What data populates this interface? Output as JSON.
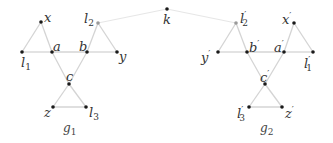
{
  "diagram": {
    "type": "graph",
    "colors": {
      "node": "#1a1a1a",
      "node_special": "#9a9a9a",
      "edge": "#d4d4d4",
      "edge_faint": "#e6e6e6",
      "label": "#333333"
    },
    "graphs": [
      {
        "name": "g1",
        "label_base": "g",
        "label_sub": "1",
        "nodes": [
          {
            "id": "x",
            "base": "x",
            "sub": "",
            "prime": "",
            "x": 41,
            "y": 22
          },
          {
            "id": "l1",
            "base": "l",
            "sub": "1",
            "prime": "",
            "x": 22,
            "y": 52
          },
          {
            "id": "a",
            "base": "a",
            "sub": "",
            "prime": "",
            "x": 52,
            "y": 52
          },
          {
            "id": "b",
            "base": "b",
            "sub": "",
            "prime": "",
            "x": 87,
            "y": 52
          },
          {
            "id": "y",
            "base": "y",
            "sub": "",
            "prime": "",
            "x": 117,
            "y": 52
          },
          {
            "id": "l2",
            "base": "l",
            "sub": "2",
            "prime": "",
            "x": 98,
            "y": 23
          },
          {
            "id": "c",
            "base": "c",
            "sub": "",
            "prime": "",
            "x": 69,
            "y": 84
          },
          {
            "id": "z",
            "base": "z",
            "sub": "",
            "prime": "",
            "x": 53,
            "y": 107
          },
          {
            "id": "l3",
            "base": "l",
            "sub": "3",
            "prime": "",
            "x": 86,
            "y": 107
          }
        ],
        "edges": [
          [
            "x",
            "l1"
          ],
          [
            "x",
            "a"
          ],
          [
            "l1",
            "a"
          ],
          [
            "a",
            "b"
          ],
          [
            "b",
            "y"
          ],
          [
            "l2",
            "b"
          ],
          [
            "l2",
            "y"
          ],
          [
            "a",
            "c"
          ],
          [
            "b",
            "c"
          ],
          [
            "c",
            "z"
          ],
          [
            "c",
            "l3"
          ],
          [
            "z",
            "l3"
          ]
        ]
      },
      {
        "name": "g2",
        "label_base": "g",
        "label_sub": "2",
        "nodes": [
          {
            "id": "l2p",
            "base": "l",
            "sub": "2",
            "prime": "′",
            "x": 236,
            "y": 23
          },
          {
            "id": "xp",
            "base": "x",
            "sub": "",
            "prime": "′",
            "x": 294,
            "y": 23
          },
          {
            "id": "yp",
            "base": "y",
            "sub": "",
            "prime": "′",
            "x": 218,
            "y": 52
          },
          {
            "id": "bp",
            "base": "b",
            "sub": "",
            "prime": "′",
            "x": 247,
            "y": 52
          },
          {
            "id": "ap",
            "base": "a",
            "sub": "",
            "prime": "′",
            "x": 284,
            "y": 52
          },
          {
            "id": "l1p",
            "base": "l",
            "sub": "1",
            "prime": "′",
            "x": 313,
            "y": 52
          },
          {
            "id": "cp",
            "base": "c",
            "sub": "",
            "prime": "′",
            "x": 265,
            "y": 84
          },
          {
            "id": "l3p",
            "base": "l",
            "sub": "3",
            "prime": "′",
            "x": 249,
            "y": 107
          },
          {
            "id": "zp",
            "base": "z",
            "sub": "",
            "prime": "′",
            "x": 282,
            "y": 107
          }
        ],
        "edges": [
          [
            "l2p",
            "yp"
          ],
          [
            "l2p",
            "bp"
          ],
          [
            "yp",
            "bp"
          ],
          [
            "bp",
            "ap"
          ],
          [
            "ap",
            "l1p"
          ],
          [
            "xp",
            "ap"
          ],
          [
            "xp",
            "l1p"
          ],
          [
            "bp",
            "cp"
          ],
          [
            "ap",
            "cp"
          ],
          [
            "cp",
            "l3p"
          ],
          [
            "cp",
            "zp"
          ],
          [
            "l3p",
            "zp"
          ]
        ]
      }
    ],
    "connector": {
      "node": {
        "id": "k",
        "base": "k",
        "x": 167,
        "y": 9
      },
      "edges": [
        [
          "l2",
          "k"
        ],
        [
          "k",
          "l2p"
        ]
      ]
    },
    "labels": {
      "x": {
        "base": "x",
        "sub": "",
        "prime": ""
      },
      "l1": {
        "base": "l",
        "sub": "1",
        "prime": ""
      },
      "a": {
        "base": "a",
        "sub": "",
        "prime": ""
      },
      "b": {
        "base": "b",
        "sub": "",
        "prime": ""
      },
      "y": {
        "base": "y",
        "sub": "",
        "prime": ""
      },
      "l2": {
        "base": "l",
        "sub": "2",
        "prime": ""
      },
      "c": {
        "base": "c",
        "sub": "",
        "prime": ""
      },
      "z": {
        "base": "z",
        "sub": "",
        "prime": ""
      },
      "l3": {
        "base": "l",
        "sub": "3",
        "prime": ""
      },
      "k": {
        "base": "k"
      },
      "l2p": {
        "base": "l",
        "sub": "2",
        "prime": "′"
      },
      "xp": {
        "base": "x",
        "sub": "",
        "prime": "′"
      },
      "yp": {
        "base": "y",
        "sub": "",
        "prime": "′"
      },
      "bp": {
        "base": "b",
        "sub": "",
        "prime": "′"
      },
      "ap": {
        "base": "a",
        "sub": "",
        "prime": "′"
      },
      "l1p": {
        "base": "l",
        "sub": "1",
        "prime": "′"
      },
      "cp": {
        "base": "c",
        "sub": "",
        "prime": "′"
      },
      "l3p": {
        "base": "l",
        "sub": "3",
        "prime": "′"
      },
      "zp": {
        "base": "z",
        "sub": "",
        "prime": "′"
      },
      "g1": {
        "base": "g",
        "sub": "1"
      },
      "g2": {
        "base": "g",
        "sub": "2"
      }
    }
  }
}
